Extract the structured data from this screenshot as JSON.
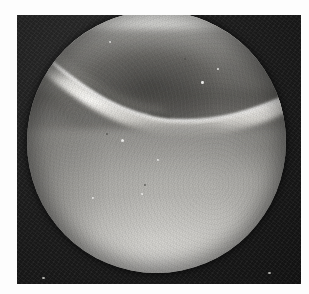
{
  "page": {
    "background_color": "#fdfdfd",
    "width": 309,
    "height": 294
  },
  "photo": {
    "title": "",
    "caption": "",
    "frame_color": "#181818",
    "frame": {
      "left": 17,
      "top": 15,
      "width": 284,
      "height": 269
    },
    "modality": "arthroscopy",
    "color_mode": "grayscale"
  },
  "field_of_view": {
    "shape": "circle",
    "label": "",
    "center_x": 139,
    "center_y": 127,
    "diameter": 259,
    "rim_color": "#141414"
  },
  "features": {
    "ridge": {
      "name": "bright-tissue-ridge",
      "label": "",
      "description_visible": false,
      "highlight_color": "#f4f3ef"
    },
    "upper_shadow": {
      "name": "upper-dark-zone",
      "label": "",
      "color": "#3e3d3a"
    },
    "lower_illuminated": {
      "name": "lower-bright-zone",
      "label": "",
      "color": "#ededea"
    }
  },
  "specks": {
    "bright": [
      {
        "x": 111,
        "y": 152,
        "r": 1.6
      },
      {
        "x": 190,
        "y": 93,
        "r": 1.4
      },
      {
        "x": 131,
        "y": 206,
        "r": 1.3
      },
      {
        "x": 82,
        "y": 210,
        "r": 1.2
      },
      {
        "x": 79,
        "y": 64,
        "r": 1.1
      },
      {
        "x": 206,
        "y": 80,
        "r": 1.0
      },
      {
        "x": 147,
        "y": 172,
        "r": 1.0
      }
    ],
    "dark": [
      {
        "x": 146,
        "y": 107,
        "r": 1.8
      },
      {
        "x": 173,
        "y": 70,
        "r": 1.2
      },
      {
        "x": 134,
        "y": 197,
        "r": 1.1
      },
      {
        "x": 96,
        "y": 146,
        "r": 1.0
      }
    ],
    "frame": [
      {
        "x": 268,
        "y": 272,
        "r": 1.6
      },
      {
        "x": 42,
        "y": 277,
        "r": 1.3
      }
    ]
  }
}
